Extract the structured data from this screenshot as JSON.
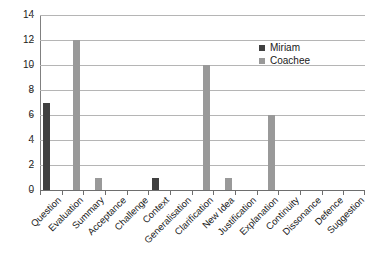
{
  "chart_data": {
    "type": "bar",
    "title": "",
    "subtitle": "",
    "xlabel": "",
    "ylabel": "",
    "ylim": [
      0,
      14
    ],
    "ytick_step": 2,
    "yticks": [
      "0",
      "2",
      "4",
      "6",
      "8",
      "10",
      "12",
      "14"
    ],
    "grid": true,
    "legend_position": "top-right-inside",
    "categories": [
      "Question",
      "Evaluation",
      "Summary",
      "Acceptance",
      "Challenge",
      "Context",
      "Generalisation",
      "Clarification",
      "New Idea",
      "Justification",
      "Explanation",
      "Continuity",
      "Dissonance",
      "Defence",
      "Suggestion"
    ],
    "series": [
      {
        "name": "Miriam",
        "color": "#404040",
        "values": [
          7,
          0,
          0,
          0,
          0,
          1,
          0,
          0,
          0,
          0,
          0,
          0,
          0,
          0,
          0
        ]
      },
      {
        "name": "Coachee",
        "color": "#999999",
        "values": [
          0,
          12,
          1,
          0,
          0,
          0,
          0,
          10,
          1,
          0,
          6,
          0,
          0,
          0,
          0
        ]
      }
    ]
  },
  "legend": {
    "entries": [
      {
        "label": "Miriam",
        "color": "#404040"
      },
      {
        "label": "Coachee",
        "color": "#999999"
      }
    ]
  },
  "axis": {
    "y_max": 14,
    "y_min": 0
  }
}
